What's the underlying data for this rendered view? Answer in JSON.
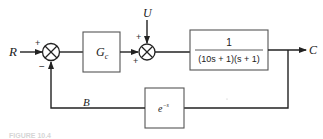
{
  "diagram": {
    "type": "block-diagram",
    "signals": {
      "input": "R",
      "disturbance": "U",
      "output": "C",
      "feedback": "B"
    },
    "sum1": {
      "signs": {
        "top": "+",
        "bottom": "−"
      }
    },
    "sum2": {
      "signs": {
        "top": "+",
        "left": "+"
      }
    },
    "controller": {
      "label": "G",
      "subscript": "c"
    },
    "plant": {
      "numerator": "1",
      "denominator": "(10s + 1)(s + 1)"
    },
    "feedback_block": {
      "base": "e",
      "exponent": "−s"
    },
    "caption": "FIGURE 10.4"
  },
  "colors": {
    "line": "#2a2a2a",
    "block_border": "#555555",
    "background": "#ffffff"
  }
}
